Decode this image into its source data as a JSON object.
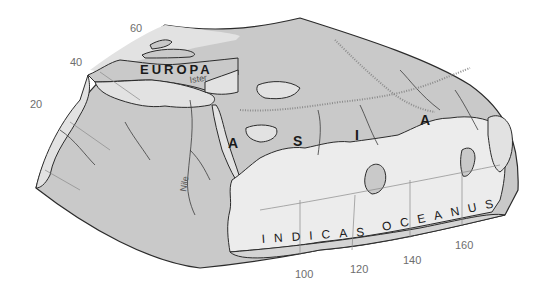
{
  "map": {
    "colors": {
      "land": "#c9c9c9",
      "land_light": "#e2e2e2",
      "sea": "#ececec",
      "frame_band": "#d4d4d4",
      "outline": "#2b2b2b",
      "graticule": "#8a8a8a",
      "river": "#3c3c3c",
      "mountains": "#8c8c8c"
    },
    "labels": {
      "europa": "EUROPA",
      "asia_letters": [
        "A",
        "S",
        "I",
        "A"
      ],
      "ocean_word1": "INDICAS",
      "ocean_word2": "OCEANUS",
      "river_ister": "Ister",
      "river_nile": "Nile"
    },
    "latitude_ticks": [
      "60",
      "40",
      "20"
    ],
    "longitude_ticks": [
      "100",
      "120",
      "140",
      "160"
    ]
  }
}
